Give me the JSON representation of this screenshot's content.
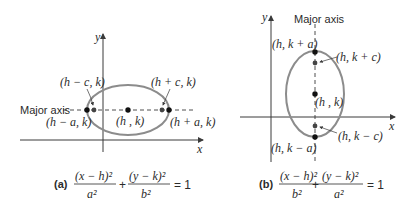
{
  "figures": {
    "a": {
      "caption_label": "(a)",
      "axis_x_label": "x",
      "axis_y_label": "y",
      "major_axis_label": "Major axis",
      "points": {
        "left_vertex": "(h − a, k)",
        "left_focus": "(h − c, k)",
        "center": "(h , k)",
        "right_focus": "(h + c, k)",
        "right_vertex": "(h + a, k)"
      },
      "equation": {
        "term1_num": "(x − h)²",
        "term1_den": "a²",
        "plus": "+",
        "term2_num": "(y − k)²",
        "term2_den": "b²",
        "rhs": "= 1"
      }
    },
    "b": {
      "caption_label": "(b)",
      "axis_x_label": "x",
      "axis_y_label": "y",
      "major_axis_label": "Major axis",
      "points": {
        "top_vertex": "(h, k + a)",
        "top_focus": "(h, k + c)",
        "center": "(h , k)",
        "bottom_focus": "(h, k − c)",
        "bottom_vertex": "(h, k − a)"
      },
      "equation": {
        "term1_num": "(x − h)²",
        "term1_den": "b²",
        "plus": "+",
        "term2_num": "(y − k)²",
        "term2_den": "a²",
        "rhs": "= 1"
      }
    }
  },
  "colors": {
    "ellipse": "#8c8c8c",
    "axis": "#3a3a3a",
    "point": "#111111",
    "focus": "#444444",
    "text": "#2b2b2b"
  }
}
